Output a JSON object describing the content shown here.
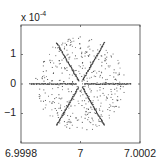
{
  "chart_data": {
    "type": "scatter",
    "title": "",
    "xlabel": "",
    "ylabel": "",
    "y_exponent_label": "x 10",
    "y_exponent_power": "-4",
    "xlim": [
      6.9998,
      7.0002
    ],
    "ylim": [
      -0.0002,
      0.0002
    ],
    "x_ticks": [
      6.9998,
      7,
      7.0002
    ],
    "x_tick_labels": [
      "6.9998",
      "7",
      "7.0002"
    ],
    "y_ticks": [
      0.0001,
      0,
      -0.0001
    ],
    "y_tick_labels": [
      "1",
      "0",
      "−1"
    ],
    "grid": false,
    "legend": null,
    "marker_color": "#333333",
    "series": [
      {
        "name": "star-arms",
        "description": "Six dense line segments from center (7, 0) at angles 0°, 60°, 120°, 180°, 240°, 300°",
        "center": [
          7,
          0
        ],
        "horizontal_half_length": 0.00017,
        "diagonal_endpoints": [
          [
            7.00008,
            0.00014
          ],
          [
            6.99992,
            0.00014
          ],
          [
            6.99992,
            -0.00014
          ],
          [
            7.00008,
            -0.00014
          ]
        ],
        "horizontal_endpoints": [
          [
            6.99983,
            0
          ],
          [
            7.00017,
            0
          ]
        ]
      },
      {
        "name": "scattered-points",
        "description": "Sparse random cloud of points around (7, 0) within radius ~1.6e-4",
        "center": [
          7,
          0
        ],
        "radius": 0.00016,
        "count": 420
      }
    ]
  }
}
